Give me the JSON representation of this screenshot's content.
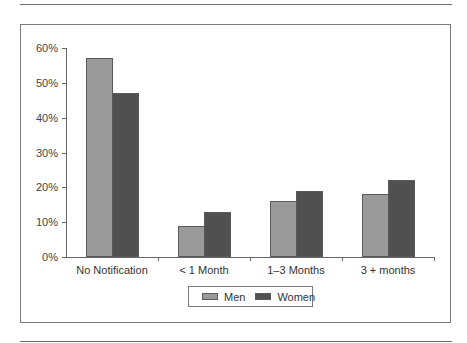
{
  "chart_data": {
    "type": "bar",
    "title": "",
    "xlabel": "",
    "ylabel": "",
    "categories": [
      "No Notification",
      "< 1 Month",
      "1–3 Months",
      "3 + months"
    ],
    "series": [
      {
        "name": "Men",
        "color": "#9a9a9a",
        "values": [
          57,
          9,
          16,
          18
        ]
      },
      {
        "name": "Women",
        "color": "#505050",
        "values": [
          47,
          13,
          19,
          22
        ]
      }
    ],
    "ylim": [
      0,
      60
    ],
    "yticks": [
      "0%",
      "10%",
      "20%",
      "30%",
      "40%",
      "50%",
      "60%"
    ],
    "value_format": "percent",
    "grid": false,
    "legend_position": "bottom-center"
  },
  "legend": {
    "items": [
      {
        "label": "Men",
        "color": "#9a9a9a"
      },
      {
        "label": "Women",
        "color": "#505050"
      }
    ]
  }
}
